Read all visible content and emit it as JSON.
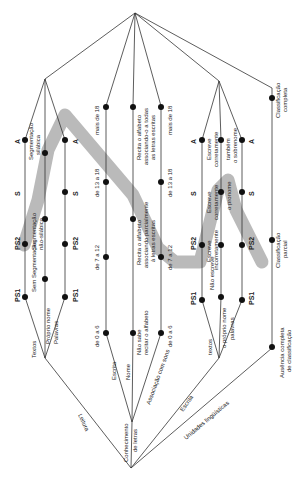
{
  "diagram": {
    "orientation": "rotated-90",
    "band_color": "#b3b3b3",
    "line_color": "#333333",
    "root_branches": {
      "leitura": "Leitura",
      "conhecimento": "Conhecimento de letras",
      "escrita": "Escrita",
      "unidades": "Unidades lingüísticas"
    },
    "leitura": {
      "textos": "Textos",
      "proprio_nome": "Próprio nome",
      "palavras": "Palavras",
      "ps1_a": "PS1",
      "ps2_a": "PS2",
      "s_a": "S",
      "a_a": "A",
      "ps1_b": "PS1",
      "ps2_b": "PS2",
      "s_b": "S",
      "a_b": "A",
      "sem_segmentacao": "Sem Segmentação",
      "segmentacao_nao_silabica": "Segmentação não-silábica",
      "segmentacao_silabica": "Segmentação silábica"
    },
    "conhecimento": {
      "escrita": "Escrita",
      "nome": "Nome",
      "associacao": "Associação com sons",
      "esc_0_6": "de 0 a 6",
      "esc_7_12": "de 7 a 12",
      "esc_13_18": "de 13 a 18",
      "esc_18": "mais de 18",
      "nao_sabe": "Não sabe recitar o alfabeto",
      "recita_parcial": "Recita o alfabeto associando parcialmente às letras escritas",
      "recita_todas": "Recita o alfabeto associando-o a todas as letras escritas",
      "as_0_6": "de 0 a 6",
      "as_7_12": "de 7 a 12",
      "as_13_18": "de 13 a 18",
      "as_18": "mais de 18"
    },
    "escrita": {
      "textos": "textos",
      "proprio_nome": "o próprio nome",
      "palavras": "palavras",
      "ps1_a": "PS1",
      "ps2_a": "PS2",
      "s_a": "S",
      "a_a": "A",
      "ps1_b": "PS1",
      "ps2_b": "PS2",
      "s_b": "S",
      "a_b": "A",
      "nao_escreve": "Não escreve",
      "escreve_incorretamente": "Escreve incorretamente",
      "escreve_corretamente_mid": "Escreve corretamente",
      "escreve_corretamente_top": "Escreve corretamente",
      "o_pronome": "o pronome",
      "tambem_sobrenome": "também o sobrenome"
    },
    "unidades": {
      "ausencia": "Ausência completa de classificação",
      "parcial": "Classificação parcial",
      "completa": "Classificação completa"
    }
  }
}
